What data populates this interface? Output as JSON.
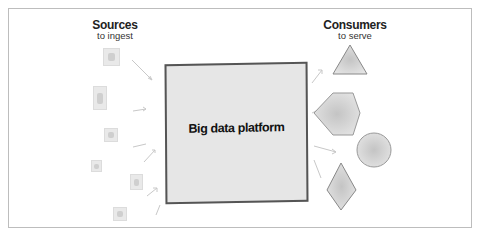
{
  "sources": {
    "title": "Sources",
    "subtitle": "to ingest",
    "items": [
      {
        "x": 103,
        "y": 48,
        "w": 17,
        "h": 18
      },
      {
        "x": 93,
        "y": 86,
        "w": 14,
        "h": 24
      },
      {
        "x": 104,
        "y": 128,
        "w": 14,
        "h": 14
      },
      {
        "x": 91,
        "y": 160,
        "w": 11,
        "h": 12
      },
      {
        "x": 130,
        "y": 174,
        "w": 13,
        "h": 16
      },
      {
        "x": 113,
        "y": 207,
        "w": 14,
        "h": 14
      }
    ]
  },
  "platform": {
    "label": "Big data platform"
  },
  "consumers": {
    "title": "Consumers",
    "subtitle": "to serve",
    "shapes": [
      "triangle",
      "hexagon",
      "circle",
      "diamond"
    ]
  },
  "colors": {
    "frame": "#bdbdbd",
    "platform_fill": "#e6e6e6",
    "platform_border": "#555555",
    "shape_fill": "#d8d8d8",
    "arrow": "#c8c8c8"
  }
}
